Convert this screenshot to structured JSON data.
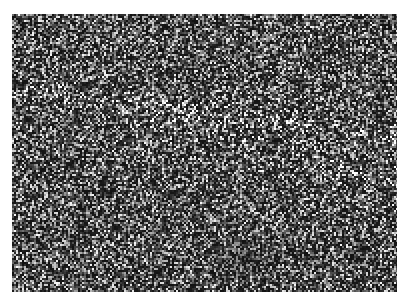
{
  "image": {
    "description": "Grayscale speckle texture micrograph",
    "width": 385,
    "height": 278,
    "background_color": "#1a1a1a",
    "speckle_color": "#d8d8d8",
    "scale_bar": {
      "visible": true,
      "color": "#969696",
      "label": ""
    }
  }
}
